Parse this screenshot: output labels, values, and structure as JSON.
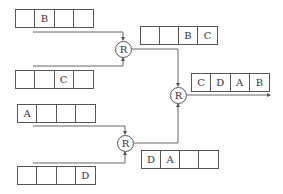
{
  "diagram": {
    "registers": [
      {
        "id": "in1",
        "cells": [
          "",
          "B",
          "",
          ""
        ]
      },
      {
        "id": "in2",
        "cells": [
          "",
          "",
          "C",
          ""
        ]
      },
      {
        "id": "in3",
        "cells": [
          "A",
          "",
          "",
          ""
        ]
      },
      {
        "id": "in4",
        "cells": [
          "",
          "",
          "",
          "D"
        ]
      },
      {
        "id": "mid1",
        "cells": [
          "",
          "",
          "B",
          "C"
        ]
      },
      {
        "id": "mid2",
        "cells": [
          "D",
          "A",
          "",
          ""
        ]
      },
      {
        "id": "out",
        "cells": [
          "C",
          "D",
          "A",
          "B"
        ]
      }
    ],
    "nodes": [
      {
        "id": "r1",
        "label": "R"
      },
      {
        "id": "r2",
        "label": "R"
      },
      {
        "id": "r3",
        "label": "R"
      }
    ],
    "colors": {
      "line": "#555555",
      "text": "#333333"
    }
  }
}
